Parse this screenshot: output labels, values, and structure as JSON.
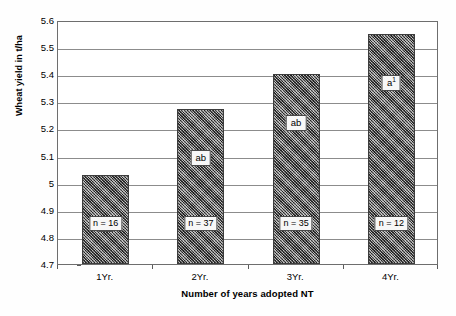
{
  "chart_data": {
    "type": "bar",
    "title": "",
    "subtitle": "",
    "xlabel": "Number of years adopted NT",
    "ylabel": "Wheat yield in t/ha",
    "categories": [
      "1Yr.",
      "2Yr.",
      "3Yr.",
      "4Yr."
    ],
    "values": [
      5.03,
      5.27,
      5.4,
      5.55
    ],
    "series": [
      {
        "name": "Wheat yield",
        "values": [
          5.03,
          5.27,
          5.4,
          5.55
        ]
      }
    ],
    "point_labels": [
      "b",
      "ab",
      "ab",
      "a"
    ],
    "point_label_superscripts": [
      "",
      "",
      "",
      "1"
    ],
    "sample_size_labels": [
      "n = 16",
      "n = 37",
      "n = 35",
      "n = 12"
    ],
    "sample_sizes": [
      16,
      37,
      35,
      12
    ],
    "ylim": [
      4.7,
      5.6
    ],
    "ytick_labels": [
      "5.6",
      "5.5",
      "5.4",
      "5.3",
      "5.2",
      "5.1",
      "5",
      "4.9",
      "4.8",
      "4.7"
    ],
    "ytick_values": [
      5.6,
      5.5,
      5.4,
      5.3,
      5.2,
      5.1,
      5.0,
      4.9,
      4.8,
      4.7
    ],
    "ytick_step": 0.1,
    "grid": true,
    "grid_axis": "y",
    "legend": false,
    "legend_position": "none",
    "bar_fill": "#6b6b6b",
    "bar_pattern": "crosshatch-dither",
    "bar_border_color": "#3d3d3d",
    "grid_color": "#8c8c8c",
    "axis_color": "#6e6e6e",
    "background_color": "#ffffff"
  }
}
